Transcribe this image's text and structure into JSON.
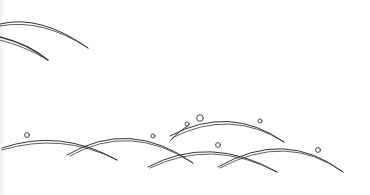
{
  "illustration": {
    "description": "Line-art of overlapping curved arcs (stylized grass blades / waves) with small circles resting on the arcs",
    "background": "#ffffff",
    "stroke_color": "#333333",
    "arc_count": 9,
    "circle_count": 8
  }
}
